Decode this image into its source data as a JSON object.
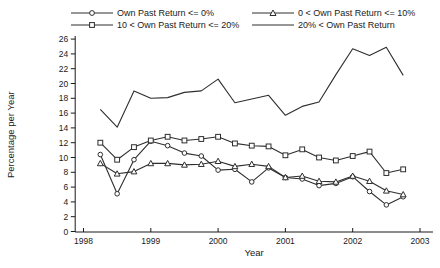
{
  "chart_data": {
    "type": "line",
    "title": "",
    "xlabel": "Year",
    "ylabel": "Percentage per Year",
    "legend_position": "top",
    "grid": false,
    "axis_color": "#1a1a1a",
    "x_axis": {
      "ticks": [
        1998,
        1999,
        2000,
        2001,
        2002,
        2003
      ],
      "range": [
        1997.87,
        2003.2
      ]
    },
    "y_axis": {
      "ticks": [
        0,
        2,
        4,
        6,
        8,
        10,
        12,
        14,
        16,
        18,
        20,
        22,
        24,
        26
      ],
      "range": [
        0,
        26
      ]
    },
    "x": [
      1998.25,
      1998.5,
      1998.75,
      1999.0,
      1999.25,
      1999.5,
      1999.75,
      2000.0,
      2000.25,
      2000.5,
      2000.75,
      2001.0,
      2001.25,
      2001.5,
      2001.75,
      2002.0,
      2002.25,
      2002.5,
      2002.75
    ],
    "series": [
      {
        "name": "Own Past Return <= 0%",
        "marker": "circle",
        "color": "#2e2e2e",
        "values": [
          10.4,
          5.1,
          9.7,
          12.2,
          11.6,
          10.6,
          10.2,
          8.3,
          8.4,
          6.7,
          8.6,
          7.3,
          7.1,
          6.2,
          6.5,
          7.4,
          5.4,
          3.6,
          4.7
        ]
      },
      {
        "name": "0 < Own Past Return <= 10%",
        "marker": "triangle",
        "color": "#2e2e2e",
        "values": [
          9.2,
          7.8,
          8.1,
          9.2,
          9.2,
          9.0,
          9.1,
          9.5,
          8.8,
          9.1,
          8.8,
          7.3,
          7.5,
          6.8,
          6.7,
          7.5,
          6.8,
          5.5,
          5.0
        ]
      },
      {
        "name": "10 < Own Past Return <= 20%",
        "marker": "square",
        "color": "#2e2e2e",
        "values": [
          12.0,
          9.7,
          11.4,
          12.3,
          12.8,
          12.3,
          12.5,
          12.8,
          11.9,
          11.6,
          11.5,
          10.3,
          11.1,
          10.0,
          9.6,
          10.2,
          10.8,
          7.9,
          8.4
        ]
      },
      {
        "name": "20% < Own Past Return",
        "marker": "none",
        "color": "#2e2e2e",
        "values": [
          16.5,
          14.1,
          19.0,
          18.0,
          18.1,
          18.8,
          19.0,
          20.6,
          17.4,
          17.9,
          18.4,
          15.7,
          16.9,
          17.5,
          21.2,
          24.7,
          23.8,
          24.9,
          21.1
        ]
      }
    ]
  }
}
